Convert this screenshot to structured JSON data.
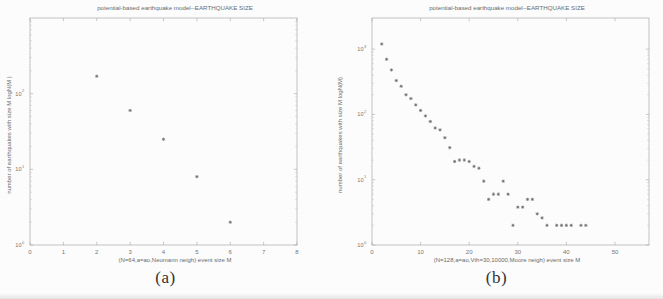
{
  "figure": {
    "caption_a": "(a)",
    "caption_b": "(b)"
  },
  "chart_data": [
    {
      "type": "scatter",
      "panel": "a",
      "title": "potential-based earthquake model--EARTHQUAKE SIZE",
      "xlabel": "(N=64,a=ao,Neumann neigh)  event size M",
      "ylabel": "number of earthquakes with size M  logN(M )",
      "xlim": [
        0,
        8
      ],
      "ylim": [
        1,
        1000
      ],
      "yscale": "log",
      "xscale": "linear",
      "xticks": [
        0,
        1,
        2,
        3,
        4,
        5,
        6,
        7,
        8
      ],
      "xticklabels": [
        "0",
        "1",
        "2",
        "3",
        "4",
        "5",
        "6",
        "7",
        "8"
      ],
      "yticks": [
        1,
        10,
        100
      ],
      "yticklabels": [
        "10",
        "10",
        "10"
      ],
      "ytickexponents": [
        "0",
        "1",
        "2"
      ],
      "grid": false,
      "legend": "none",
      "marker": "star",
      "x": [
        2,
        3,
        4,
        5,
        6
      ],
      "y": [
        170,
        60,
        25,
        8,
        2
      ]
    },
    {
      "type": "scatter",
      "panel": "b",
      "title": "potential-based earthquake model--EARTHQUAKE SIZE",
      "xlabel": "(N=128,a=ao,Vth=30,10000,Moore neigh)   event size M",
      "ylabel": "number of earthquakes with size M  logN(M)",
      "xlim": [
        0,
        57
      ],
      "ylim": [
        1,
        3000
      ],
      "yscale": "log",
      "xscale": "linear",
      "xticks": [
        0,
        10,
        20,
        30,
        40,
        50
      ],
      "xticklabels": [
        "0",
        "10",
        "20",
        "30",
        "40",
        "50"
      ],
      "yticks": [
        1,
        10,
        100,
        1000
      ],
      "yticklabels": [
        "10",
        "10",
        "10",
        "10"
      ],
      "ytickexponents": [
        "0",
        "1",
        "2",
        "3"
      ],
      "grid": false,
      "legend": "none",
      "marker": "star",
      "x": [
        2,
        3,
        4,
        5,
        6,
        7,
        8,
        9,
        10,
        11,
        12,
        13,
        14,
        15,
        16,
        17,
        18,
        19,
        20,
        21,
        22,
        23,
        24,
        25,
        26,
        27,
        28,
        29,
        30,
        31,
        32,
        33,
        34,
        35,
        36,
        38,
        39,
        40,
        41,
        43,
        44
      ],
      "y": [
        1200,
        700,
        480,
        330,
        270,
        200,
        175,
        140,
        115,
        95,
        78,
        62,
        58,
        44,
        31,
        19,
        20,
        20,
        19,
        16,
        15,
        9.5,
        5,
        6,
        6,
        9.5,
        6,
        2,
        3.8,
        3.8,
        5,
        5,
        3,
        2.6,
        2,
        2,
        2,
        2,
        2,
        2,
        2
      ]
    }
  ]
}
